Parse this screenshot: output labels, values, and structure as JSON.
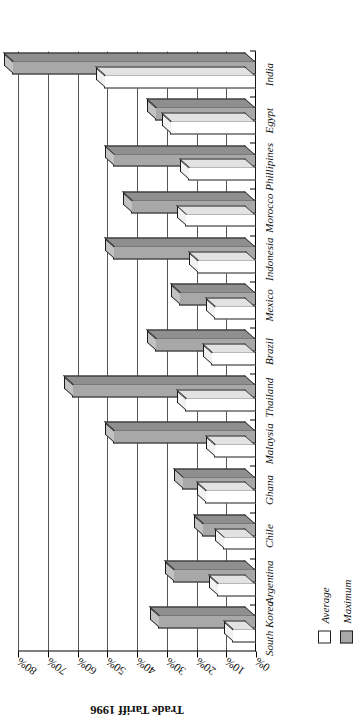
{
  "chart_data": {
    "type": "bar",
    "title": "",
    "xlabel": "",
    "ylabel": "Trade Tariff 1996",
    "ylim": [
      0,
      80
    ],
    "ytick_values": [
      0,
      10,
      20,
      30,
      40,
      50,
      60,
      70,
      80
    ],
    "ytick_labels": [
      "0%",
      "10%",
      "20%",
      "30%",
      "40%",
      "50%",
      "60%",
      "70%",
      "80%"
    ],
    "grid": true,
    "legend_position": "bottom-left",
    "orientation": "vertical-3d",
    "categories": [
      "South Korea",
      "Argentina",
      "Chile",
      "Ghana",
      "Malaysia",
      "Thailand",
      "Brazil",
      "Mexico",
      "Indonesia",
      "Morocco",
      "Phillipines",
      "Egypt",
      "India"
    ],
    "series": [
      {
        "name": "Average",
        "color": "#ffffff",
        "values": [
          8,
          13,
          11,
          17,
          14,
          24,
          15,
          14,
          20,
          24,
          23,
          29,
          51
        ]
      },
      {
        "name": "Maximum",
        "color": "#a8a8a8",
        "values": [
          33,
          28,
          18,
          25,
          48,
          62,
          34,
          26,
          48,
          42,
          48,
          34,
          82
        ]
      }
    ]
  },
  "legend": {
    "items": [
      {
        "label": "Average",
        "swatch": "white-square"
      },
      {
        "label": "Maximum",
        "swatch": "gray-square"
      }
    ]
  },
  "axis": {
    "y_title": "Trade Tariff 1996"
  }
}
